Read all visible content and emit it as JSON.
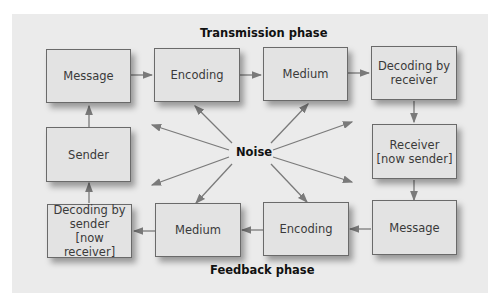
{
  "diagram": {
    "title_top": "Transmission phase",
    "title_bottom": "Feedback phase",
    "center_label": "Noise",
    "colors": {
      "box_fill": "#e3e3e3",
      "box_border": "#6a6a6a",
      "arrow": "#7a7a7a",
      "panel": "#ebebeb"
    },
    "transmission": [
      {
        "label": "Message"
      },
      {
        "label": "Encoding"
      },
      {
        "label": "Medium"
      },
      {
        "label": "Decoding by\nreceiver"
      }
    ],
    "middle": {
      "left": "Sender",
      "right": "Receiver\n[now sender]"
    },
    "feedback": [
      {
        "label": "Decoding by\nsender\n[now receiver]"
      },
      {
        "label": "Medium"
      },
      {
        "label": "Encoding"
      },
      {
        "label": "Message"
      }
    ]
  }
}
